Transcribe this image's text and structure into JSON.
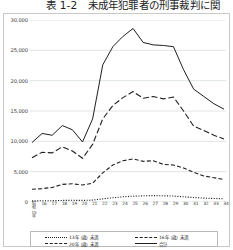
{
  "title": "表 1-2　未成年犯罪者の刑事裁判に関",
  "chart_data": {
    "type": "line",
    "title": "表 1-2　未成年犯罪者の刑事裁判に関",
    "xlabel": "",
    "ylabel": "",
    "ylim": [
      0,
      30000
    ],
    "grid": true,
    "legend_position": "bottom",
    "ytick_labels": [
      "30,000",
      "25,000",
      "20,000",
      "15,000",
      "10,000",
      "5,000",
      "0"
    ],
    "ytick_values": [
      30000,
      25000,
      20000,
      15000,
      10000,
      5000,
      0
    ],
    "categories": [
      "昭和15年",
      "16",
      "17",
      "18",
      "19",
      "20",
      "21",
      "22",
      "23",
      "24",
      "25",
      "26",
      "27",
      "28",
      "29",
      "30",
      "31",
      "32",
      "33",
      "34"
    ],
    "x_first_label_lines": "昭\n和\n15\n年",
    "series": [
      {
        "name": "合計",
        "style": "solid",
        "values": [
          9800,
          11300,
          11000,
          12600,
          11900,
          9900,
          13700,
          22600,
          25600,
          27300,
          28600,
          26300,
          25900,
          25800,
          25600,
          21800,
          18600,
          17400,
          16200,
          15300
        ]
      },
      {
        "name": "16年（歳）未満",
        "style": "long-dash",
        "values": [
          7300,
          8200,
          8100,
          9100,
          8400,
          7200,
          9500,
          13700,
          15900,
          17200,
          18200,
          17100,
          17400,
          17000,
          17300,
          15000,
          12500,
          11800,
          11000,
          10400
        ]
      },
      {
        "name": "20年（歳）未満",
        "style": "dashed",
        "values": [
          2100,
          2200,
          2400,
          2900,
          3000,
          2800,
          3100,
          4800,
          6100,
          6800,
          7100,
          6700,
          6800,
          6200,
          6100,
          5600,
          4900,
          4300,
          4000,
          3700
        ]
      },
      {
        "name": "13年（歳）未満",
        "style": "dotted",
        "values": [
          180,
          200,
          220,
          260,
          280,
          260,
          320,
          520,
          700,
          860,
          960,
          1020,
          1060,
          1020,
          980,
          860,
          740,
          640,
          580,
          520
        ]
      }
    ],
    "legend_entries": [
      {
        "label": "13年（歳）未満",
        "style": "dotted"
      },
      {
        "label": "16年（歳）未満",
        "style": "long-dash"
      },
      {
        "label": "20年（歳）未満",
        "style": "dashed"
      },
      {
        "label": "合計",
        "style": "solid"
      }
    ],
    "line_color": "#1f1f1f",
    "grid_color": "#d8dde2"
  }
}
